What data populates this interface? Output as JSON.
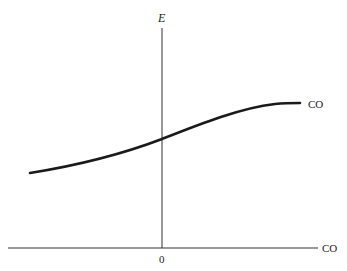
{
  "diagram": {
    "y_axis_label": "E",
    "x_axis_label": "CO",
    "origin_label": "0",
    "curve_label": "CO",
    "colors": {
      "curve": "#1a1a1a",
      "axes": "#333333",
      "background": "#ffffff"
    }
  }
}
